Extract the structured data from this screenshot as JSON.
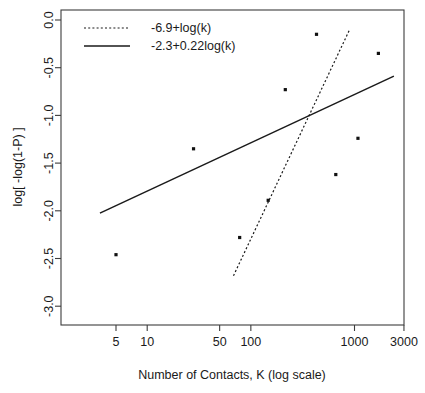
{
  "chart_data": {
    "type": "scatter",
    "title": "",
    "subtitle": "",
    "xlabel": "Number of Contacts, K (log scale)",
    "ylabel": "log[ -log(1-P) ]",
    "x_scale": "log",
    "y_scale": "linear",
    "xlim": [
      3,
      3000
    ],
    "ylim": [
      -3.1,
      0.05
    ],
    "grid": false,
    "legend_position": "top-left",
    "x_ticks": [
      {
        "value": 5,
        "label": "5"
      },
      {
        "value": 10,
        "label": "10"
      },
      {
        "value": 50,
        "label": "50"
      },
      {
        "value": 100,
        "label": "100"
      },
      {
        "value": 1000,
        "label": "1000"
      },
      {
        "value": 3000,
        "label": "3000"
      }
    ],
    "y_ticks": [
      {
        "value": 0.0,
        "label": "0.0"
      },
      {
        "value": -0.5,
        "label": "-0.5"
      },
      {
        "value": -1.0,
        "label": "-1.0"
      },
      {
        "value": -1.5,
        "label": "-1.5"
      },
      {
        "value": -2.0,
        "label": "-2.0"
      },
      {
        "value": -2.5,
        "label": "-2.5"
      },
      {
        "value": -3.0,
        "label": "-3.0"
      }
    ],
    "points": [
      {
        "x": 5,
        "y": -2.46
      },
      {
        "x": 28,
        "y": -1.35
      },
      {
        "x": 78,
        "y": -2.28
      },
      {
        "x": 147,
        "y": -1.89
      },
      {
        "x": 215,
        "y": -0.73
      },
      {
        "x": 430,
        "y": -0.15
      },
      {
        "x": 660,
        "y": -1.62
      },
      {
        "x": 1080,
        "y": -1.24
      },
      {
        "x": 1700,
        "y": -0.35
      }
    ],
    "series": [
      {
        "name": "-6.9+log(k)",
        "style": "dotted",
        "intercept": -6.9,
        "slope": 1.0,
        "basis": "log(k)",
        "x_start": 68,
        "x_end": 900,
        "color": "#1a1a1a"
      },
      {
        "name": "-2.3+0.22log(k)",
        "style": "solid",
        "intercept": -2.3,
        "slope": 0.22,
        "basis": "log(k)",
        "x_start": 3.5,
        "x_end": 2400,
        "color": "#1a1a1a"
      }
    ],
    "legend": [
      {
        "label": "-6.9+log(k)",
        "style": "dotted"
      },
      {
        "label": "-2.3+0.22log(k)",
        "style": "solid"
      }
    ]
  }
}
